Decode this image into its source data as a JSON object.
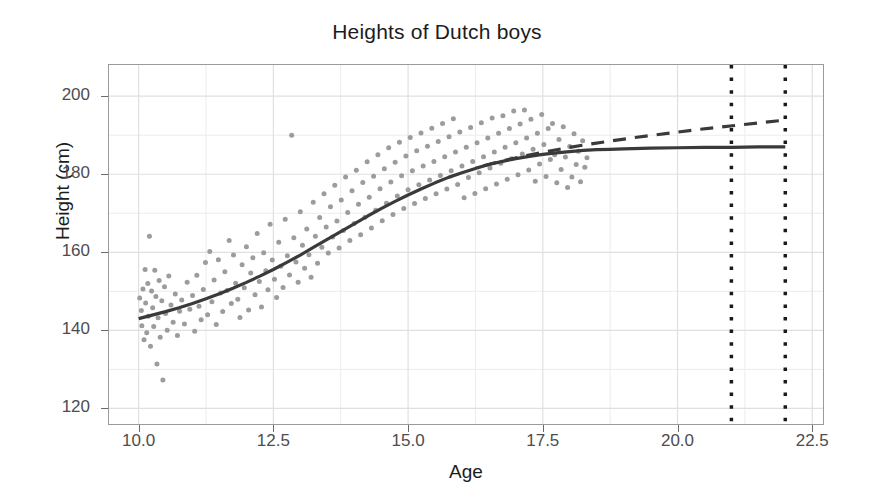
{
  "chart_data": {
    "type": "scatter",
    "title": "Heights of Dutch boys",
    "xlabel": "Age",
    "ylabel": "Height (cm)",
    "xlim": [
      9.45,
      22.7
    ],
    "ylim": [
      116.0,
      208.0
    ],
    "grid": true,
    "legend": null,
    "xticks": [
      "10.0",
      "12.5",
      "15.0",
      "17.5",
      "20.0",
      "22.5"
    ],
    "xtick_values": [
      10.0,
      12.5,
      15.0,
      17.5,
      20.0,
      22.5
    ],
    "yticks": [
      "120",
      "140",
      "160",
      "180",
      "200"
    ],
    "ytick_values": [
      120,
      140,
      160,
      180,
      200
    ],
    "minor_yticks": [
      130,
      150,
      170,
      190
    ],
    "minor_xticks": [
      11.25,
      13.75,
      16.25,
      18.75,
      21.25
    ],
    "point_color": "#9c9c9c",
    "line_color": "#3a3a3a",
    "grid_color": "#ececec",
    "panel_border_color": "#9a9a9a",
    "background": "#ffffff",
    "annotations": [
      {
        "name": "vertical-dotted-line-1",
        "type": "vline",
        "x": 21.0,
        "style": "dotted",
        "color": "#1a1a1a",
        "width": 3.5
      },
      {
        "name": "vertical-dotted-line-2",
        "type": "vline",
        "x": 22.0,
        "style": "dotted",
        "color": "#1a1a1a",
        "width": 3.5
      }
    ],
    "series": [
      {
        "name": "fitted-curve-solid",
        "type": "line",
        "style": "solid",
        "color": "#3a3a3a",
        "width": 3.2,
        "points": [
          [
            10.0,
            143.0
          ],
          [
            10.25,
            143.9
          ],
          [
            10.5,
            144.8
          ],
          [
            10.75,
            145.8
          ],
          [
            11.0,
            146.9
          ],
          [
            11.25,
            148.1
          ],
          [
            11.5,
            149.4
          ],
          [
            11.75,
            150.8
          ],
          [
            12.0,
            152.3
          ],
          [
            12.25,
            153.9
          ],
          [
            12.5,
            155.6
          ],
          [
            12.75,
            157.4
          ],
          [
            13.0,
            159.3
          ],
          [
            13.25,
            161.3
          ],
          [
            13.5,
            163.3
          ],
          [
            13.75,
            165.3
          ],
          [
            14.0,
            167.3
          ],
          [
            14.25,
            169.3
          ],
          [
            14.5,
            171.2
          ],
          [
            14.75,
            173.0
          ],
          [
            15.0,
            174.7
          ],
          [
            15.25,
            176.3
          ],
          [
            15.5,
            177.8
          ],
          [
            15.75,
            179.2
          ],
          [
            16.0,
            180.4
          ],
          [
            16.25,
            181.5
          ],
          [
            16.5,
            182.5
          ],
          [
            16.75,
            183.3
          ],
          [
            17.0,
            184.0
          ],
          [
            17.25,
            184.6
          ],
          [
            17.5,
            185.1
          ],
          [
            17.75,
            185.5
          ],
          [
            18.0,
            185.8
          ],
          [
            18.25,
            186.1
          ],
          [
            18.5,
            186.3
          ],
          [
            18.75,
            186.4
          ],
          [
            19.0,
            186.5
          ],
          [
            19.5,
            186.7
          ],
          [
            20.0,
            186.8
          ],
          [
            20.5,
            186.9
          ],
          [
            21.0,
            186.9
          ],
          [
            21.5,
            187.0
          ],
          [
            22.0,
            187.0
          ]
        ]
      },
      {
        "name": "extrapolation-dashed",
        "type": "line",
        "style": "dashed",
        "color": "#3a3a3a",
        "width": 3.2,
        "dash": "13,9",
        "points": [
          [
            16.4,
            182.2
          ],
          [
            16.8,
            183.6
          ],
          [
            17.2,
            184.8
          ],
          [
            17.6,
            185.9
          ],
          [
            18.0,
            186.9
          ],
          [
            18.4,
            187.8
          ],
          [
            18.8,
            188.6
          ],
          [
            19.2,
            189.4
          ],
          [
            19.6,
            190.1
          ],
          [
            20.0,
            190.8
          ],
          [
            20.4,
            191.5
          ],
          [
            20.8,
            192.1
          ],
          [
            21.2,
            192.7
          ],
          [
            21.6,
            193.3
          ],
          [
            22.0,
            193.9
          ]
        ]
      },
      {
        "name": "observed-heights-scatter",
        "type": "scatter",
        "color": "#9c9c9c",
        "marker_size": 5,
        "n_points": 430,
        "x_range": [
          9.95,
          18.35
        ],
        "y_range": [
          127.0,
          196.5
        ],
        "description": "Individual Dutch boys height measurements by age",
        "points": [
          [
            10.02,
            148.3
          ],
          [
            10.05,
            145.1
          ],
          [
            10.06,
            141.2
          ],
          [
            10.08,
            150.6
          ],
          [
            10.1,
            137.6
          ],
          [
            10.12,
            155.6
          ],
          [
            10.13,
            147.0
          ],
          [
            10.15,
            139.4
          ],
          [
            10.17,
            152.0
          ],
          [
            10.18,
            143.6
          ],
          [
            10.2,
            164.1
          ],
          [
            10.22,
            135.9
          ],
          [
            10.24,
            150.1
          ],
          [
            10.26,
            145.8
          ],
          [
            10.28,
            141.0
          ],
          [
            10.3,
            155.4
          ],
          [
            10.32,
            148.7
          ],
          [
            10.34,
            131.4
          ],
          [
            10.36,
            143.2
          ],
          [
            10.38,
            152.8
          ],
          [
            10.4,
            138.2
          ],
          [
            10.43,
            147.6
          ],
          [
            10.45,
            127.3
          ],
          [
            10.48,
            151.2
          ],
          [
            10.5,
            144.3
          ],
          [
            10.53,
            140.0
          ],
          [
            10.56,
            153.9
          ],
          [
            10.6,
            146.5
          ],
          [
            10.64,
            142.1
          ],
          [
            10.68,
            149.3
          ],
          [
            10.72,
            138.7
          ],
          [
            10.76,
            144.9
          ],
          [
            10.8,
            147.8
          ],
          [
            10.85,
            141.6
          ],
          [
            10.9,
            152.3
          ],
          [
            10.95,
            145.4
          ],
          [
            11.0,
            148.9
          ],
          [
            11.04,
            139.8
          ],
          [
            11.08,
            154.1
          ],
          [
            11.12,
            146.2
          ],
          [
            11.16,
            142.7
          ],
          [
            11.2,
            150.5
          ],
          [
            11.24,
            157.4
          ],
          [
            11.28,
            144.0
          ],
          [
            11.32,
            160.2
          ],
          [
            11.36,
            147.3
          ],
          [
            11.4,
            152.9
          ],
          [
            11.44,
            141.5
          ],
          [
            11.48,
            158.1
          ],
          [
            11.52,
            149.6
          ],
          [
            11.56,
            144.8
          ],
          [
            11.6,
            155.0
          ],
          [
            11.64,
            150.2
          ],
          [
            11.68,
            163.0
          ],
          [
            11.72,
            146.9
          ],
          [
            11.76,
            159.3
          ],
          [
            11.8,
            152.1
          ],
          [
            11.84,
            148.0
          ],
          [
            11.88,
            143.3
          ],
          [
            11.92,
            156.8
          ],
          [
            11.96,
            150.9
          ],
          [
            12.0,
            161.4
          ],
          [
            12.04,
            145.2
          ],
          [
            12.08,
            154.7
          ],
          [
            12.12,
            158.6
          ],
          [
            12.16,
            149.1
          ],
          [
            12.2,
            164.8
          ],
          [
            12.24,
            152.5
          ],
          [
            12.28,
            146.0
          ],
          [
            12.32,
            159.9
          ],
          [
            12.36,
            155.3
          ],
          [
            12.4,
            150.4
          ],
          [
            12.44,
            167.2
          ],
          [
            12.48,
            158.0
          ],
          [
            12.52,
            153.1
          ],
          [
            12.56,
            148.4
          ],
          [
            12.6,
            162.6
          ],
          [
            12.64,
            156.4
          ],
          [
            12.68,
            151.0
          ],
          [
            12.72,
            168.5
          ],
          [
            12.76,
            159.1
          ],
          [
            12.8,
            154.2
          ],
          [
            12.84,
            190.0
          ],
          [
            12.88,
            163.7
          ],
          [
            12.92,
            157.5
          ],
          [
            12.96,
            152.3
          ],
          [
            13.0,
            170.4
          ],
          [
            13.04,
            161.8
          ],
          [
            13.08,
            155.9
          ],
          [
            13.12,
            166.0
          ],
          [
            13.16,
            159.4
          ],
          [
            13.2,
            153.6
          ],
          [
            13.24,
            172.8
          ],
          [
            13.28,
            164.1
          ],
          [
            13.32,
            157.2
          ],
          [
            13.36,
            168.9
          ],
          [
            13.4,
            161.3
          ],
          [
            13.44,
            175.0
          ],
          [
            13.48,
            166.5
          ],
          [
            13.52,
            159.8
          ],
          [
            13.56,
            171.7
          ],
          [
            13.6,
            163.9
          ],
          [
            13.64,
            177.2
          ],
          [
            13.68,
            168.0
          ],
          [
            13.72,
            161.1
          ],
          [
            13.76,
            173.4
          ],
          [
            13.8,
            165.6
          ],
          [
            13.84,
            179.3
          ],
          [
            13.88,
            170.2
          ],
          [
            13.92,
            163.0
          ],
          [
            13.96,
            175.8
          ],
          [
            14.0,
            167.4
          ],
          [
            14.04,
            181.0
          ],
          [
            14.08,
            172.3
          ],
          [
            14.12,
            164.5
          ],
          [
            14.16,
            177.9
          ],
          [
            14.2,
            169.0
          ],
          [
            14.24,
            183.2
          ],
          [
            14.28,
            174.1
          ],
          [
            14.32,
            166.2
          ],
          [
            14.36,
            179.5
          ],
          [
            14.4,
            170.8
          ],
          [
            14.44,
            185.0
          ],
          [
            14.48,
            176.3
          ],
          [
            14.52,
            168.1
          ],
          [
            14.56,
            181.4
          ],
          [
            14.6,
            172.6
          ],
          [
            14.64,
            186.8
          ],
          [
            14.68,
            178.0
          ],
          [
            14.72,
            169.7
          ],
          [
            14.76,
            183.1
          ],
          [
            14.8,
            174.4
          ],
          [
            14.84,
            188.2
          ],
          [
            14.88,
            179.6
          ],
          [
            14.92,
            171.2
          ],
          [
            14.96,
            184.7
          ],
          [
            15.0,
            176.0
          ],
          [
            15.04,
            189.4
          ],
          [
            15.08,
            180.9
          ],
          [
            15.12,
            172.5
          ],
          [
            15.16,
            186.0
          ],
          [
            15.2,
            177.3
          ],
          [
            15.24,
            190.6
          ],
          [
            15.28,
            182.1
          ],
          [
            15.32,
            173.8
          ],
          [
            15.36,
            187.2
          ],
          [
            15.4,
            178.5
          ],
          [
            15.44,
            191.8
          ],
          [
            15.48,
            183.3
          ],
          [
            15.52,
            175.0
          ],
          [
            15.56,
            188.4
          ],
          [
            15.6,
            179.7
          ],
          [
            15.64,
            193.0
          ],
          [
            15.68,
            184.5
          ],
          [
            15.72,
            176.2
          ],
          [
            15.76,
            189.6
          ],
          [
            15.8,
            180.9
          ],
          [
            15.84,
            194.2
          ],
          [
            15.88,
            185.7
          ],
          [
            15.92,
            177.4
          ],
          [
            15.96,
            190.8
          ],
          [
            16.0,
            182.1
          ],
          [
            16.04,
            174.0
          ],
          [
            16.08,
            186.9
          ],
          [
            16.12,
            179.2
          ],
          [
            16.16,
            192.0
          ],
          [
            16.2,
            183.3
          ],
          [
            16.24,
            175.1
          ],
          [
            16.28,
            188.1
          ],
          [
            16.32,
            180.4
          ],
          [
            16.36,
            193.2
          ],
          [
            16.4,
            184.5
          ],
          [
            16.44,
            176.3
          ],
          [
            16.48,
            189.3
          ],
          [
            16.52,
            181.6
          ],
          [
            16.56,
            194.4
          ],
          [
            16.6,
            185.7
          ],
          [
            16.64,
            177.5
          ],
          [
            16.68,
            190.5
          ],
          [
            16.72,
            182.8
          ],
          [
            16.76,
            195.0
          ],
          [
            16.8,
            186.9
          ],
          [
            16.84,
            178.7
          ],
          [
            16.88,
            191.7
          ],
          [
            16.92,
            184.0
          ],
          [
            16.96,
            196.2
          ],
          [
            17.0,
            188.1
          ],
          [
            17.04,
            179.9
          ],
          [
            17.08,
            192.9
          ],
          [
            17.12,
            185.2
          ],
          [
            17.16,
            196.5
          ],
          [
            17.2,
            189.3
          ],
          [
            17.24,
            181.1
          ],
          [
            17.28,
            194.1
          ],
          [
            17.32,
            186.4
          ],
          [
            17.36,
            178.2
          ],
          [
            17.4,
            190.5
          ],
          [
            17.44,
            182.6
          ],
          [
            17.48,
            195.3
          ],
          [
            17.52,
            187.6
          ],
          [
            17.56,
            179.4
          ],
          [
            17.6,
            191.7
          ],
          [
            17.64,
            183.8
          ],
          [
            17.68,
            193.0
          ],
          [
            17.72,
            185.0
          ],
          [
            17.76,
            177.8
          ],
          [
            17.8,
            188.9
          ],
          [
            17.84,
            181.2
          ],
          [
            17.88,
            192.2
          ],
          [
            17.92,
            184.4
          ],
          [
            17.96,
            176.6
          ],
          [
            18.0,
            187.1
          ],
          [
            18.04,
            179.3
          ],
          [
            18.08,
            190.4
          ],
          [
            18.12,
            182.5
          ],
          [
            18.16,
            185.9
          ],
          [
            18.2,
            178.1
          ],
          [
            18.24,
            188.6
          ],
          [
            18.28,
            181.8
          ],
          [
            18.32,
            184.2
          ]
        ]
      }
    ]
  }
}
